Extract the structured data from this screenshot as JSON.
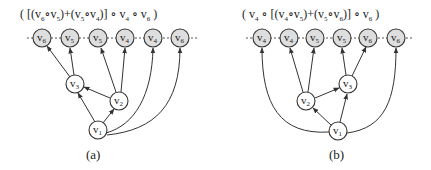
{
  "panels": [
    {
      "id": "a",
      "caption": "(a)",
      "expression": "( [(v6∘v5)+(v5∘v4)] ∘ v4 ∘ v6 )",
      "expression_parts": [
        "( [(",
        "v",
        "6",
        "∘",
        "v",
        "5",
        ")+(",
        "v",
        "5",
        "∘",
        "v",
        "4",
        ")] ∘ ",
        "v",
        "4",
        " ∘ ",
        "v",
        "6",
        " )"
      ],
      "top_nodes": [
        {
          "name": "v",
          "sub": "6"
        },
        {
          "name": "v",
          "sub": "5"
        },
        {
          "name": "v",
          "sub": "5"
        },
        {
          "name": "v",
          "sub": "4"
        },
        {
          "name": "v",
          "sub": "4"
        },
        {
          "name": "v",
          "sub": "6"
        }
      ],
      "inner_nodes": [
        {
          "id": "v1",
          "name": "v",
          "sub": "1"
        },
        {
          "id": "v2",
          "name": "v",
          "sub": "2"
        },
        {
          "id": "v3",
          "name": "v",
          "sub": "3"
        }
      ],
      "edges": [
        {
          "from": "v3",
          "to": "top0"
        },
        {
          "from": "v3",
          "to": "top1"
        },
        {
          "from": "v2",
          "to": "top2"
        },
        {
          "from": "v2",
          "to": "top3"
        },
        {
          "from": "v1",
          "to": "top4",
          "curved": true
        },
        {
          "from": "v1",
          "to": "top5",
          "curved": true
        },
        {
          "from": "v1",
          "to": "v3"
        },
        {
          "from": "v1",
          "to": "v2"
        },
        {
          "from": "v2",
          "to": "v3"
        }
      ]
    },
    {
      "id": "b",
      "caption": "(b)",
      "expression": "( v4 ∘ [(v4∘v5)+(v5∘v6)] ∘ v6 )",
      "top_nodes": [
        {
          "name": "v",
          "sub": "4"
        },
        {
          "name": "v",
          "sub": "4"
        },
        {
          "name": "v",
          "sub": "5"
        },
        {
          "name": "v",
          "sub": "5"
        },
        {
          "name": "v",
          "sub": "6"
        },
        {
          "name": "v",
          "sub": "6"
        }
      ],
      "inner_nodes": [
        {
          "id": "v1",
          "name": "v",
          "sub": "1"
        },
        {
          "id": "v2",
          "name": "v",
          "sub": "2"
        },
        {
          "id": "v3",
          "name": "v",
          "sub": "3"
        }
      ],
      "edges": [
        {
          "from": "v1",
          "to": "top0",
          "curved": true
        },
        {
          "from": "v2",
          "to": "top1"
        },
        {
          "from": "v2",
          "to": "top2"
        },
        {
          "from": "v3",
          "to": "top3"
        },
        {
          "from": "v3",
          "to": "top4"
        },
        {
          "from": "v1",
          "to": "top5",
          "curved": true
        },
        {
          "from": "v1",
          "to": "v2"
        },
        {
          "from": "v1",
          "to": "v3"
        },
        {
          "from": "v2",
          "to": "v3"
        }
      ]
    }
  ],
  "colors": {
    "top_node_fill": "#dedede",
    "inner_node_fill": "#ffffff",
    "stroke": "#333333"
  }
}
